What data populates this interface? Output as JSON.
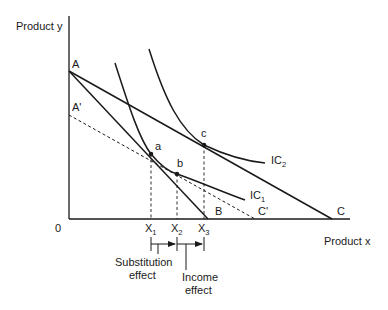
{
  "diagram": {
    "axes": {
      "y_label": "Product y",
      "x_label": "Product x",
      "origin_label": "0"
    },
    "budget_lines": [
      {
        "name": "AB",
        "from": "A",
        "to": "B",
        "style": "solid"
      },
      {
        "name": "AC",
        "from": "A",
        "to": "C",
        "style": "solid"
      },
      {
        "name": "A'C'",
        "from": "A'",
        "to": "C'",
        "style": "dashed"
      }
    ],
    "points": {
      "A": "A",
      "A_prime": "A'",
      "B": "B",
      "C": "C",
      "C_prime": "C'",
      "a": "a",
      "b": "b",
      "c": "c"
    },
    "indifference_curves": [
      {
        "label": "IC",
        "subscript": "1"
      },
      {
        "label": "IC",
        "subscript": "2"
      }
    ],
    "x_ticks": [
      {
        "label": "X",
        "subscript": "1"
      },
      {
        "label": "X",
        "subscript": "2"
      },
      {
        "label": "X",
        "subscript": "3"
      }
    ],
    "effects": {
      "substitution_line1": "Substitution",
      "substitution_line2": "effect",
      "income_line1": "Income",
      "income_line2": "effect"
    }
  }
}
